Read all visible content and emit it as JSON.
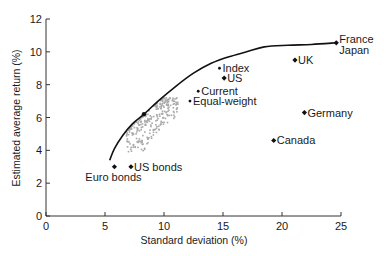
{
  "chart_data": {
    "type": "scatter",
    "title": "",
    "xlabel": "Standard deviation (%)",
    "ylabel": "Estimated average return (%)",
    "xlim": [
      0,
      25
    ],
    "ylim": [
      0,
      12
    ],
    "xticks": [
      0,
      5,
      10,
      15,
      20,
      25
    ],
    "yticks": [
      0,
      2,
      4,
      6,
      8,
      10,
      12
    ],
    "grid": false,
    "legend": "none",
    "frontier": {
      "name": "Efficient frontier",
      "points": [
        [
          5.4,
          3.4
        ],
        [
          5.8,
          4.1
        ],
        [
          6.5,
          4.9
        ],
        [
          7.3,
          5.6
        ],
        [
          8.3,
          6.2
        ],
        [
          9.5,
          7.0
        ],
        [
          11.0,
          7.9
        ],
        [
          12.5,
          8.7
        ],
        [
          14.0,
          9.3
        ],
        [
          15.5,
          9.7
        ],
        [
          17.0,
          10.0
        ],
        [
          18.5,
          10.3
        ],
        [
          20.5,
          10.4
        ],
        [
          22.5,
          10.45
        ],
        [
          24.6,
          10.55
        ]
      ],
      "marked_point": [
        8.3,
        6.2
      ]
    },
    "labeled_points": [
      {
        "name": "France\nJapan",
        "lines": [
          "France",
          "Japan"
        ],
        "x": 24.6,
        "y": 10.55,
        "marker": "diamond",
        "label_pos": "right"
      },
      {
        "name": "UK",
        "lines": [
          "UK"
        ],
        "x": 21.1,
        "y": 9.5,
        "marker": "diamond",
        "label_pos": "right"
      },
      {
        "name": "Index",
        "lines": [
          "Index"
        ],
        "x": 14.7,
        "y": 9.0,
        "marker": "dot",
        "label_pos": "right"
      },
      {
        "name": "US",
        "lines": [
          "US"
        ],
        "x": 15.1,
        "y": 8.4,
        "marker": "diamond",
        "label_pos": "right"
      },
      {
        "name": "Current",
        "lines": [
          "Current"
        ],
        "x": 12.9,
        "y": 7.6,
        "marker": "dot",
        "label_pos": "right"
      },
      {
        "name": "Equal-weight",
        "lines": [
          "Equal-weight"
        ],
        "x": 12.2,
        "y": 7.0,
        "marker": "dot",
        "label_pos": "right"
      },
      {
        "name": "Germany",
        "lines": [
          "Germany"
        ],
        "x": 21.9,
        "y": 6.3,
        "marker": "diamond",
        "label_pos": "right"
      },
      {
        "name": "Canada",
        "lines": [
          "Canada"
        ],
        "x": 19.3,
        "y": 4.6,
        "marker": "diamond",
        "label_pos": "right"
      },
      {
        "name": "US bonds",
        "lines": [
          "US bonds"
        ],
        "x": 7.2,
        "y": 3.0,
        "marker": "diamond",
        "label_pos": "right"
      },
      {
        "name": "Euro bonds",
        "lines": [
          "Euro bonds"
        ],
        "x": 5.8,
        "y": 3.0,
        "marker": "diamond",
        "label_pos": "below"
      }
    ],
    "simulated_cloud": {
      "name": "Simulated portfolios",
      "color": "#a9a9a9",
      "x_range": [
        6.8,
        11.2
      ],
      "y_range": [
        3.9,
        7.2
      ],
      "count": 260
    }
  },
  "colors": {
    "axis": "#333333",
    "frontier": "#111111",
    "markers": "#111111",
    "cloud": "#a9a9a9"
  }
}
